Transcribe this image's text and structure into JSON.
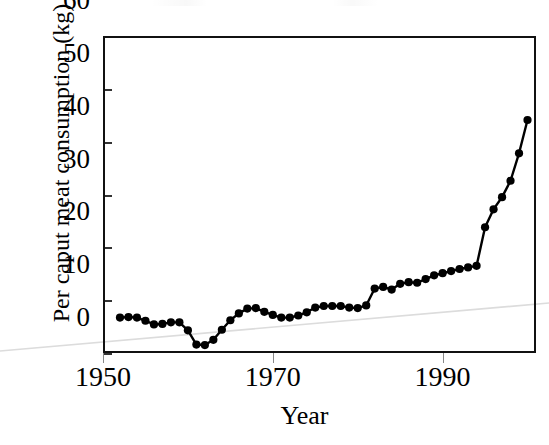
{
  "chart_data": {
    "type": "line",
    "title": "",
    "xlabel": "Year",
    "ylabel": "Per caput meat consumption (kg)",
    "xlim": [
      1950,
      2001
    ],
    "ylim": [
      0,
      60
    ],
    "xticks": [
      1950,
      1970,
      1990
    ],
    "xtick_labels": [
      "1950",
      "1970",
      "1990"
    ],
    "yticks": [
      0,
      10,
      20,
      30,
      40,
      50,
      60
    ],
    "ytick_labels": [
      "0",
      "10",
      "20",
      "30",
      "40",
      "50",
      "60"
    ],
    "grid": false,
    "legend": null,
    "marker": "filled-circle",
    "line_color": "#000000",
    "marker_color": "#000000",
    "series": [
      {
        "name": "Per caput meat consumption",
        "units": "kg",
        "x": [
          1952,
          1953,
          1954,
          1955,
          1956,
          1957,
          1958,
          1959,
          1960,
          1961,
          1962,
          1963,
          1964,
          1965,
          1966,
          1967,
          1968,
          1969,
          1970,
          1971,
          1972,
          1973,
          1974,
          1975,
          1976,
          1977,
          1978,
          1979,
          1980,
          1981,
          1982,
          1983,
          1984,
          1985,
          1986,
          1987,
          1988,
          1989,
          1990,
          1991,
          1992,
          1993,
          1994,
          1995,
          1996,
          1997,
          1998,
          1999,
          2000
        ],
        "y": [
          6.7,
          6.8,
          6.7,
          6.1,
          5.4,
          5.5,
          5.8,
          5.8,
          4.3,
          1.6,
          1.5,
          2.5,
          4.4,
          6.2,
          7.5,
          8.4,
          8.5,
          7.8,
          7.2,
          6.7,
          6.7,
          7.1,
          7.7,
          8.6,
          8.9,
          8.9,
          8.9,
          8.6,
          8.5,
          9.0,
          12.2,
          12.5,
          12.0,
          13.1,
          13.4,
          13.3,
          14.0,
          14.7,
          15.1,
          15.5,
          15.9,
          16.2,
          16.5,
          23.8,
          27.2,
          29.5,
          32.6,
          37.8,
          44.1
        ]
      }
    ],
    "annotations": []
  },
  "axes": {
    "y_title": "Per caput meat consumption (kg)",
    "x_title": "Year",
    "y_ticks": [
      {
        "value": 60,
        "label": "60"
      },
      {
        "value": 50,
        "label": "50"
      },
      {
        "value": 40,
        "label": "40"
      },
      {
        "value": 30,
        "label": "30"
      },
      {
        "value": 20,
        "label": "20"
      },
      {
        "value": 10,
        "label": "10"
      },
      {
        "value": 0,
        "label": "0"
      }
    ],
    "x_ticks": [
      {
        "value": 1950,
        "label": "1950"
      },
      {
        "value": 1970,
        "label": "1970"
      },
      {
        "value": 1990,
        "label": "1990"
      }
    ]
  },
  "colors": {
    "line": "#000000",
    "marker": "#000000",
    "frame": "#111111",
    "tick": "#333333",
    "background": "#ffffff",
    "bleed_line": "#d8d8d8"
  }
}
